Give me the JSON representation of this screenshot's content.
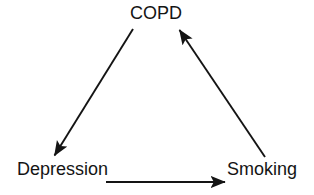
{
  "diagram": {
    "type": "cycle-diagram",
    "background_color": "#ffffff",
    "stroke_color": "#141414",
    "nodes": [
      {
        "id": "copd",
        "label": "COPD",
        "position": "top-center"
      },
      {
        "id": "depression",
        "label": "Depression",
        "position": "bottom-left"
      },
      {
        "id": "smoking",
        "label": "Smoking",
        "position": "bottom-right"
      }
    ],
    "edges": [
      {
        "id": "copd-to-depression",
        "from": "COPD",
        "to": "Depression",
        "arrowhead": "end",
        "direction": "down-left"
      },
      {
        "id": "depression-to-smoking",
        "from": "Depression",
        "to": "Smoking",
        "arrowhead": "end",
        "direction": "right"
      },
      {
        "id": "smoking-to-copd",
        "from": "Smoking",
        "to": "COPD",
        "arrowhead": "end",
        "direction": "up-left"
      }
    ]
  }
}
